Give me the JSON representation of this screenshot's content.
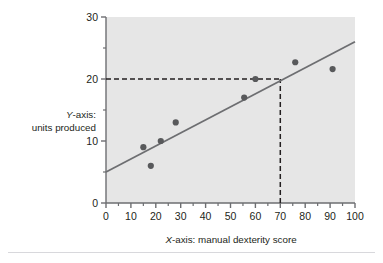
{
  "figure": {
    "background_color": "#ffffff",
    "plot_background_color": "#e6e6e6",
    "axis_color": "#6d6e71",
    "point_color": "#58595b",
    "line_color": "#6d6e71",
    "dashed_guide_color": "#231f20",
    "rule_color": "#d8d8dc"
  },
  "labels": {
    "y_axis_title_line1": "Y-axis:",
    "y_axis_title_line2": "units produced",
    "y_axis_title_italic_prefix": "Y",
    "y_axis_title_rest": "-axis:",
    "x_axis_title_italic_prefix": "X",
    "x_axis_title_rest": "-axis: manual dexterity score",
    "x_axis_title_full": "X-axis: manual dexterity score"
  },
  "chart_data": {
    "type": "scatter",
    "title": "",
    "subtitle": "",
    "xlabel": "X-axis: manual dexterity score",
    "ylabel": "Y-axis: units produced",
    "xlim": [
      0,
      100
    ],
    "ylim": [
      0,
      30
    ],
    "xticks": [
      0,
      10,
      20,
      30,
      40,
      50,
      60,
      70,
      80,
      90,
      100
    ],
    "xtick_labels": [
      "0",
      "10",
      "20",
      "30",
      "40",
      "50",
      "60",
      "70",
      "80",
      "90",
      "100"
    ],
    "yticks": [
      0,
      10,
      20,
      30
    ],
    "ytick_labels": [
      "0",
      "10",
      "20",
      "30"
    ],
    "y_minor_ticks": [
      5,
      15,
      25
    ],
    "x_minor_ticks": [
      5,
      15,
      25,
      35,
      45,
      55,
      65,
      75,
      85,
      95
    ],
    "grid": false,
    "legend": null,
    "points": [
      {
        "x": 15,
        "y": 9
      },
      {
        "x": 18,
        "y": 6
      },
      {
        "x": 22,
        "y": 10
      },
      {
        "x": 28,
        "y": 13
      },
      {
        "x": 55.5,
        "y": 17
      },
      {
        "x": 60,
        "y": 20
      },
      {
        "x": 76,
        "y": 22.7
      },
      {
        "x": 91,
        "y": 21.6
      }
    ],
    "regression_line": {
      "name": "line of best fit",
      "x_start": 0,
      "y_start": 5,
      "x_end": 100,
      "y_end": 26
    },
    "guide_lines": [
      {
        "name": "horizontal-guide",
        "y": 20,
        "x_from": 0,
        "x_to": 70,
        "style": "dashed"
      },
      {
        "name": "vertical-guide",
        "x": 70,
        "y_from": 0,
        "y_to": 20,
        "style": "dashed"
      }
    ],
    "annotations": []
  }
}
